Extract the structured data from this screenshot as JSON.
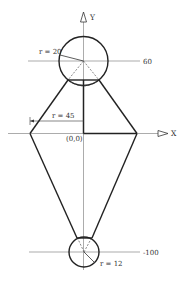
{
  "diagram": {
    "axes": {
      "x_label": "X",
      "y_label": "Y",
      "origin_label": "(0,0)"
    },
    "upper_circle": {
      "radius_label": "r = 20",
      "center_line_label": "60"
    },
    "lower_circle": {
      "radius_label": "r = 12",
      "center_line_label": "-100"
    },
    "half_width": {
      "radius_label": "r = 45"
    },
    "colors": {
      "stroke": "#222222",
      "thin_stroke": "#777777",
      "background": "#ffffff"
    }
  }
}
